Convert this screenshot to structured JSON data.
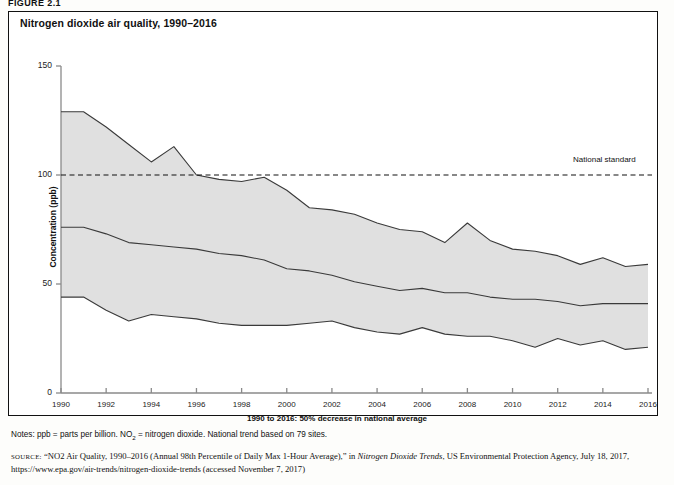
{
  "figure": {
    "label": "FIGURE 2.1",
    "title": "Nitrogen dioxide air quality, 1990–2016"
  },
  "notes": {
    "prefix": "Notes: ppb = parts per billion. NO",
    "subscript": "2",
    "suffix": " = nitrogen dioxide. National trend based on 79 sites."
  },
  "source": {
    "tag": "SOURCE:",
    "part1": "“NO2 Air Quality, 1990–2016 (Annual 98th Percentile of Daily Max 1-Hour Average),” in ",
    "italic": "Nitrogen Dioxide Trends",
    "part2": ", US Environmental Protection Agency, July 18, 2017, https://www.epa.gov/air-trends/nitrogen-dioxide-trends (accessed November 7, 2017)"
  },
  "colors": {
    "band_fill": "#e0e0e0",
    "line": "#3a3a3a",
    "axis": "#8a8a8a",
    "standard_line": "#111111",
    "frame": "#111111"
  },
  "chart_data": {
    "type": "area",
    "title": "Nitrogen dioxide air quality, 1990–2016",
    "xlabel": "1990 to 2016: 50% decrease in national average",
    "ylabel": "Concentration (ppb)",
    "xlim": [
      1990,
      2016
    ],
    "ylim": [
      0,
      150
    ],
    "yticks": [
      0,
      50,
      100,
      150
    ],
    "xticks": [
      1990,
      1992,
      1994,
      1996,
      1998,
      2000,
      2002,
      2004,
      2006,
      2008,
      2010,
      2012,
      2014,
      2016
    ],
    "grid": false,
    "legend": "none",
    "annotations": [
      {
        "text": "National standard",
        "y": 100,
        "x": 2013
      },
      {
        "text": "1990 to 2016: 50% decrease in national average",
        "position": "below-x-axis"
      }
    ],
    "x": [
      1990,
      1991,
      1992,
      1993,
      1994,
      1995,
      1996,
      1997,
      1998,
      1999,
      2000,
      2001,
      2002,
      2003,
      2004,
      2005,
      2006,
      2007,
      2008,
      2009,
      2010,
      2011,
      2012,
      2013,
      2014,
      2015,
      2016
    ],
    "series": [
      {
        "name": "90th percentile",
        "role": "upper-bound",
        "values": [
          129,
          129,
          122,
          114,
          106,
          113,
          100,
          98,
          97,
          99,
          93,
          85,
          84,
          82,
          78,
          75,
          74,
          69,
          78,
          70,
          66,
          65,
          63,
          59,
          62,
          58,
          59
        ]
      },
      {
        "name": "National average",
        "role": "mean",
        "values": [
          76,
          76,
          73,
          69,
          68,
          67,
          66,
          64,
          63,
          61,
          57,
          56,
          54,
          51,
          49,
          47,
          48,
          46,
          46,
          44,
          43,
          43,
          42,
          40,
          41,
          41,
          41
        ]
      },
      {
        "name": "10th percentile",
        "role": "lower-bound",
        "values": [
          44,
          44,
          38,
          33,
          36,
          35,
          34,
          32,
          31,
          31,
          31,
          32,
          33,
          30,
          28,
          27,
          30,
          27,
          26,
          26,
          24,
          21,
          25,
          22,
          24,
          20,
          21
        ]
      }
    ],
    "reference_line": {
      "label": "National standard",
      "value": 100,
      "style": "dashed"
    }
  }
}
